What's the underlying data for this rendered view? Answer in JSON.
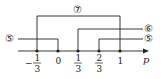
{
  "diagram": {
    "axis_variable": "p",
    "ticks": [
      {
        "id": "neg-one-third",
        "sign": "−",
        "numerator": "1",
        "denominator": "3",
        "value": -0.3333
      },
      {
        "id": "zero",
        "text": "0",
        "value": 0
      },
      {
        "id": "one-third",
        "numerator": "1",
        "denominator": "3",
        "value": 0.3333
      },
      {
        "id": "two-thirds",
        "numerator": "2",
        "denominator": "3",
        "value": 0.6667
      },
      {
        "id": "one",
        "text": "1",
        "value": 1
      }
    ],
    "ranges": [
      {
        "label": "⑦",
        "from": "-1/3",
        "to": "1",
        "closed_from": true,
        "closed_to": true
      },
      {
        "label": "⑥",
        "from": "1/3",
        "to": "+∞",
        "closed_from": true
      },
      {
        "label": "⑤",
        "from": "2/3",
        "to": "+∞",
        "closed_from": true
      },
      {
        "label": "⑤",
        "from": "-∞",
        "to": "0",
        "closed_to": true
      }
    ],
    "colors": {
      "line": "#222222",
      "text": "#222222"
    }
  }
}
